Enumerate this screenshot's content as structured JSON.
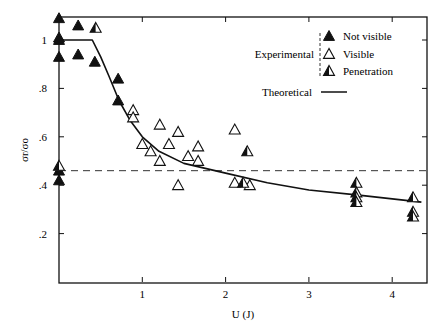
{
  "chart_data": {
    "type": "scatter",
    "title": "",
    "xlabel": "U (J)",
    "ylabel": "σr/σo",
    "xlim": [
      0,
      4.4
    ],
    "ylim": [
      0,
      1.1
    ],
    "x_ticks": [
      1,
      2,
      3,
      4
    ],
    "x_tick_labels": [
      "1",
      "2",
      "3",
      "4"
    ],
    "y_ticks": [
      0.2,
      0.4,
      0.6,
      0.8,
      1.0
    ],
    "y_tick_labels": [
      ".2",
      ".4",
      ".6",
      ".8",
      "1"
    ],
    "grid": false,
    "legend_position": "upper right",
    "legend": {
      "group_label": "Experimental",
      "entries": [
        {
          "name": "Not visible",
          "marker": "filled-triangle"
        },
        {
          "name": "Visible",
          "marker": "open-triangle"
        },
        {
          "name": "Penetration",
          "marker": "half-filled-triangle"
        }
      ],
      "line_label": "Theoretical"
    },
    "reference_line": {
      "type": "horizontal-dashed",
      "y": 0.46
    },
    "series": [
      {
        "name": "Not visible",
        "marker": "filled",
        "points": [
          [
            0,
            1.09
          ],
          [
            0.23,
            1.06
          ],
          [
            0,
            1.0
          ],
          [
            0,
            1.01
          ],
          [
            0,
            0.93
          ],
          [
            0.23,
            0.94
          ],
          [
            0.43,
            0.91
          ],
          [
            0.71,
            0.84
          ],
          [
            0.71,
            0.75
          ],
          [
            0,
            0.46
          ],
          [
            0,
            0.42
          ]
        ]
      },
      {
        "name": "Visible",
        "marker": "open",
        "points": [
          [
            0.89,
            0.71
          ],
          [
            0.89,
            0.68
          ],
          [
            1.21,
            0.65
          ],
          [
            1.43,
            0.62
          ],
          [
            1.0,
            0.57
          ],
          [
            1.32,
            0.57
          ],
          [
            1.67,
            0.56
          ],
          [
            1.1,
            0.54
          ],
          [
            1.21,
            0.5
          ],
          [
            1.55,
            0.52
          ],
          [
            1.67,
            0.5
          ],
          [
            1.43,
            0.4
          ],
          [
            2.11,
            0.63
          ],
          [
            2.11,
            0.41
          ],
          [
            2.29,
            0.4
          ]
        ]
      },
      {
        "name": "Penetration",
        "marker": "half",
        "points": [
          [
            0.44,
            1.05
          ],
          [
            0,
            0.48
          ],
          [
            2.26,
            0.54
          ],
          [
            2.21,
            0.41
          ],
          [
            3.57,
            0.41
          ],
          [
            3.57,
            0.37
          ],
          [
            3.57,
            0.35
          ],
          [
            3.57,
            0.33
          ],
          [
            4.25,
            0.35
          ],
          [
            4.25,
            0.29
          ],
          [
            4.25,
            0.27
          ]
        ]
      },
      {
        "name": "Theoretical",
        "type": "line",
        "points": [
          [
            0,
            1.0
          ],
          [
            0.4,
            1.0
          ],
          [
            0.5,
            0.93
          ],
          [
            0.6,
            0.85
          ],
          [
            0.72,
            0.75
          ],
          [
            0.85,
            0.67
          ],
          [
            1.0,
            0.6
          ],
          [
            1.2,
            0.54
          ],
          [
            1.5,
            0.49
          ],
          [
            2.0,
            0.45
          ],
          [
            2.5,
            0.41
          ],
          [
            3.0,
            0.38
          ],
          [
            3.57,
            0.36
          ],
          [
            4.35,
            0.33
          ]
        ]
      }
    ]
  }
}
